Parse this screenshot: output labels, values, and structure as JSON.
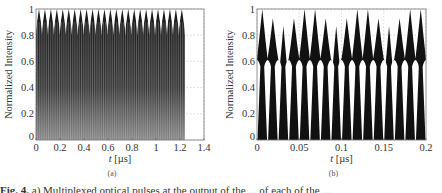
{
  "chart_data": [
    {
      "id": "a",
      "type": "area",
      "subtitle": "(a)",
      "xlabel": "t [µs]",
      "ylabel": "Normalized Intensity",
      "xlim": [
        0,
        1.4
      ],
      "ylim": [
        0,
        1
      ],
      "xticks": [
        "0",
        "0.2",
        "0.4",
        "0.6",
        "0.8",
        "1",
        "1.2",
        "1.4"
      ],
      "yticks": [
        "0",
        "0.2",
        "0.4",
        "0.6",
        "0.8",
        "1"
      ],
      "grid": true,
      "description": "Densely multiplexed optical pulse train, rapid oscillation between 0 and ~1 from t=0 to ~1.24 µs; ~25 envelope peaks reaching 1 with inter-peak dips to ~0.85",
      "data_end": 1.24,
      "envelope_peaks": 25,
      "envelope_max": 1.0,
      "envelope_dip": 0.85,
      "fill_color": "#2a2a2a"
    },
    {
      "id": "b",
      "type": "area",
      "subtitle": "(b)",
      "xlabel": "t [µs]",
      "ylabel": "Normalized Intensity",
      "xlim": [
        0,
        0.2
      ],
      "ylim": [
        0,
        1
      ],
      "xticks": [
        "0",
        "0.05",
        "0.1",
        "0.15",
        "0.2"
      ],
      "yticks": [
        "0",
        "0.2",
        "0.4",
        "0.6",
        "0.8",
        "1"
      ],
      "grid": true,
      "description": "Zoomed view: periodic pulses dropping to 0 every ~0.0125 µs, peak heights cycling 1.0, 0.93, 0.87, 0.93, 1.0",
      "period": 0.0125,
      "x": [
        0.0,
        0.00625,
        0.0125,
        0.01875,
        0.025,
        0.03125,
        0.0375,
        0.04375,
        0.05,
        0.05625,
        0.0625,
        0.06875,
        0.075,
        0.08125,
        0.0875,
        0.09375,
        0.1,
        0.10625,
        0.1125,
        0.11875,
        0.125,
        0.13125,
        0.1375,
        0.14375,
        0.15,
        0.15625,
        0.1625,
        0.16875,
        0.175,
        0.18125,
        0.1875,
        0.19375,
        0.2
      ],
      "peak_values": [
        1.0,
        0.93,
        0.87,
        0.93,
        1.0,
        1.0,
        0.93,
        0.87,
        0.93,
        1.0,
        1.0,
        0.93,
        0.87,
        0.93,
        1.0,
        1.0
      ],
      "shoulder_values": [
        0.75,
        0.72,
        0.58,
        0.72,
        0.75,
        0.75,
        0.72,
        0.58,
        0.72,
        0.75,
        0.75,
        0.72,
        0.58,
        0.72,
        0.75,
        0.75
      ],
      "fill_color": "#111111"
    }
  ],
  "caption": {
    "label": "Fig. 4.",
    "text": " a) Multiplexed optical pulses at the output of the ... of each of the ..."
  }
}
